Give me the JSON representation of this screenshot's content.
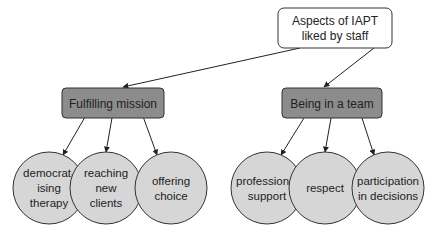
{
  "root": {
    "lines": [
      "Aspects of IAPT",
      "liked by staff"
    ]
  },
  "branches": [
    {
      "label": "Fulfilling mission",
      "children": [
        {
          "lines": [
            "democrat-",
            "ising",
            "therapy"
          ]
        },
        {
          "lines": [
            "reaching",
            "new",
            "clients"
          ]
        },
        {
          "lines": [
            "offering",
            "choice"
          ]
        }
      ]
    },
    {
      "label": "Being in a team",
      "children": [
        {
          "lines": [
            "professional",
            "support"
          ]
        },
        {
          "lines": [
            "respect"
          ]
        },
        {
          "lines": [
            "participation",
            "in decisions"
          ]
        }
      ]
    }
  ],
  "colors": {
    "root_fill": "#ffffff",
    "branch_fill": "#8c8c8c",
    "leaf_fill": "#d6d6d6",
    "stroke": "#333333"
  }
}
